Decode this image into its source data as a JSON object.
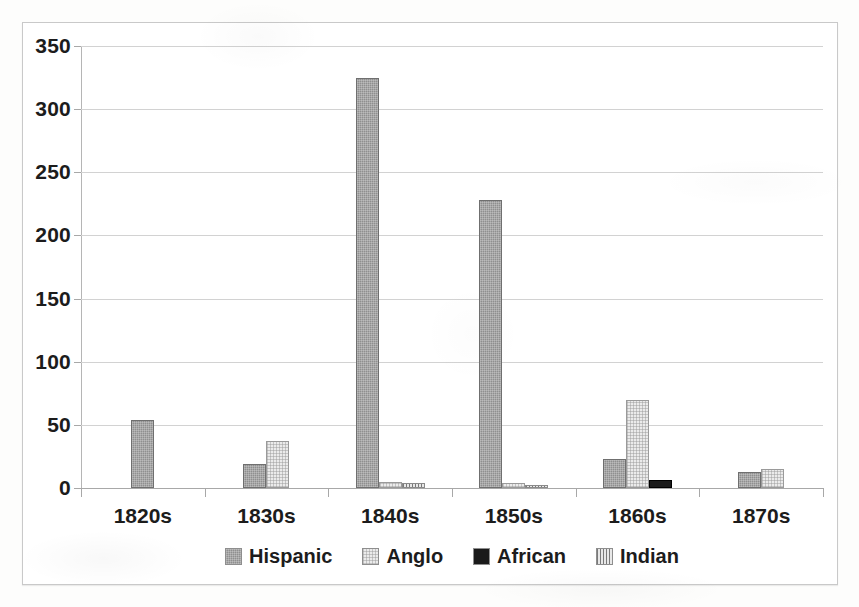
{
  "chart_data": {
    "type": "bar",
    "title": "",
    "subtitle": "",
    "xlabel": "",
    "ylabel": "",
    "categories": [
      "1820s",
      "1830s",
      "1840s",
      "1850s",
      "1860s",
      "1870s"
    ],
    "series": [
      {
        "name": "Hispanic",
        "swatch": "sw-hispanic",
        "color": "#8f8f8f",
        "values": [
          54,
          19,
          325,
          228,
          23,
          13
        ]
      },
      {
        "name": "Anglo",
        "swatch": "sw-anglo",
        "color": "#ebebeb",
        "values": [
          0,
          37,
          5,
          4,
          70,
          15
        ]
      },
      {
        "name": "African",
        "swatch": "sw-african",
        "color": "#1a1a1a",
        "values": [
          0,
          0,
          0,
          0,
          6,
          0
        ]
      },
      {
        "name": "Indian",
        "swatch": "sw-indian",
        "color": "#cfcfcf",
        "values": [
          0,
          0,
          4,
          2,
          0,
          0
        ]
      }
    ],
    "ylim": [
      0,
      350
    ],
    "yticks": [
      350,
      300,
      250,
      200,
      150,
      100,
      50,
      0
    ],
    "ytick_labels": [
      "350",
      "300",
      "250",
      "200",
      "150",
      "100",
      "50",
      "0"
    ],
    "grid": true,
    "legend_position": "bottom"
  },
  "legend": {
    "items": [
      {
        "label": "Hispanic"
      },
      {
        "label": "Anglo"
      },
      {
        "label": "African"
      },
      {
        "label": "Indian"
      }
    ]
  }
}
